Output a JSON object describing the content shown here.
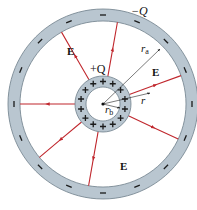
{
  "diagram": {
    "colors": {
      "ring_fill": "#b9c6d0",
      "ring_stroke": "#6f7f8a",
      "field_line": "#c0272d",
      "arrow": "#222222",
      "background": "#ffffff"
    },
    "center": {
      "x": 103,
      "y": 104
    },
    "outer_shell": {
      "outer_r": 95,
      "inner_r": 83,
      "charge_label": "−Q",
      "charge_symbol": "−"
    },
    "inner_shell": {
      "outer_r": 28,
      "inner_r": 17,
      "charge_label": "+Q",
      "charge_symbol": "+"
    },
    "labels": {
      "outer_charge": "−Q",
      "inner_charge": "+Q",
      "field_top_left": "E",
      "field_right": "E",
      "field_bottom": "E",
      "radius_a": "r",
      "radius_a_sub": "a",
      "radius_b": "r",
      "radius_b_sub": "b",
      "radius_r": "r"
    },
    "field_line_angles_deg": [
      -120,
      -80,
      -20,
      25,
      100,
      140,
      180
    ]
  }
}
